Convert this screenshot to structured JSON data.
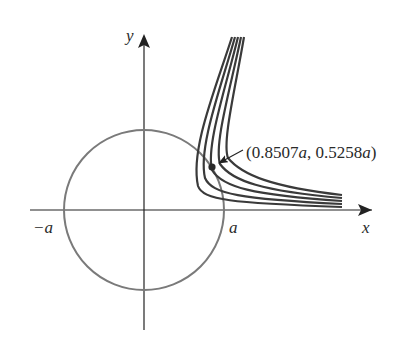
{
  "figure": {
    "axes": {
      "x_label": "x",
      "y_label": "y",
      "tick_neg_a": "−a",
      "tick_pos_a": "a"
    },
    "circle": {
      "radius_label": "a",
      "color": "#777777"
    },
    "level_curves": {
      "count": 5,
      "color": "#3a3a3a"
    },
    "point": {
      "label": "(0.8507a, 0.5258a)",
      "label_parts": [
        "(0.8507",
        "a",
        ", 0.5258",
        "a",
        ")"
      ],
      "x": 0.8507,
      "y": 0.5258
    }
  }
}
